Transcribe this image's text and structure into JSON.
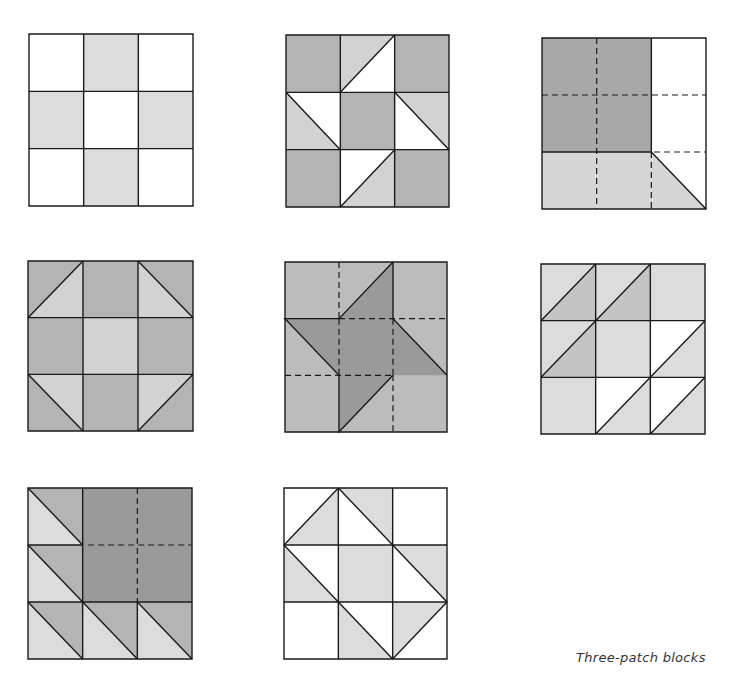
{
  "caption": "Three-patch blocks",
  "colors": {
    "white": "#ffffff",
    "light": "#dcdcdc",
    "medium": "#b4b4b4",
    "dark": "#9a9a9a",
    "outline": "#1a1a1a"
  },
  "blocks": [
    {
      "id": "block-1",
      "x": 29,
      "y": 34,
      "w": 164,
      "h": 172,
      "pattern": "nine-patch"
    },
    {
      "id": "block-2",
      "x": 286,
      "y": 35,
      "w": 163,
      "h": 172,
      "pattern": "friendship-star"
    },
    {
      "id": "block-3",
      "x": 542,
      "y": 38,
      "w": 164,
      "h": 171,
      "pattern": "large-square-corner"
    },
    {
      "id": "block-4",
      "x": 28,
      "y": 261,
      "w": 165,
      "h": 170,
      "pattern": "shoofly"
    },
    {
      "id": "block-5",
      "x": 285,
      "y": 262,
      "w": 162,
      "h": 170,
      "pattern": "pinwheel-star"
    },
    {
      "id": "block-6",
      "x": 541,
      "y": 264,
      "w": 164,
      "h": 170,
      "pattern": "half-square-triangles"
    },
    {
      "id": "block-7",
      "x": 28,
      "y": 488,
      "w": 164,
      "h": 171,
      "pattern": "bear-paw-variation"
    },
    {
      "id": "block-8",
      "x": 284,
      "y": 488,
      "w": 163,
      "h": 171,
      "pattern": "square-in-square"
    }
  ]
}
